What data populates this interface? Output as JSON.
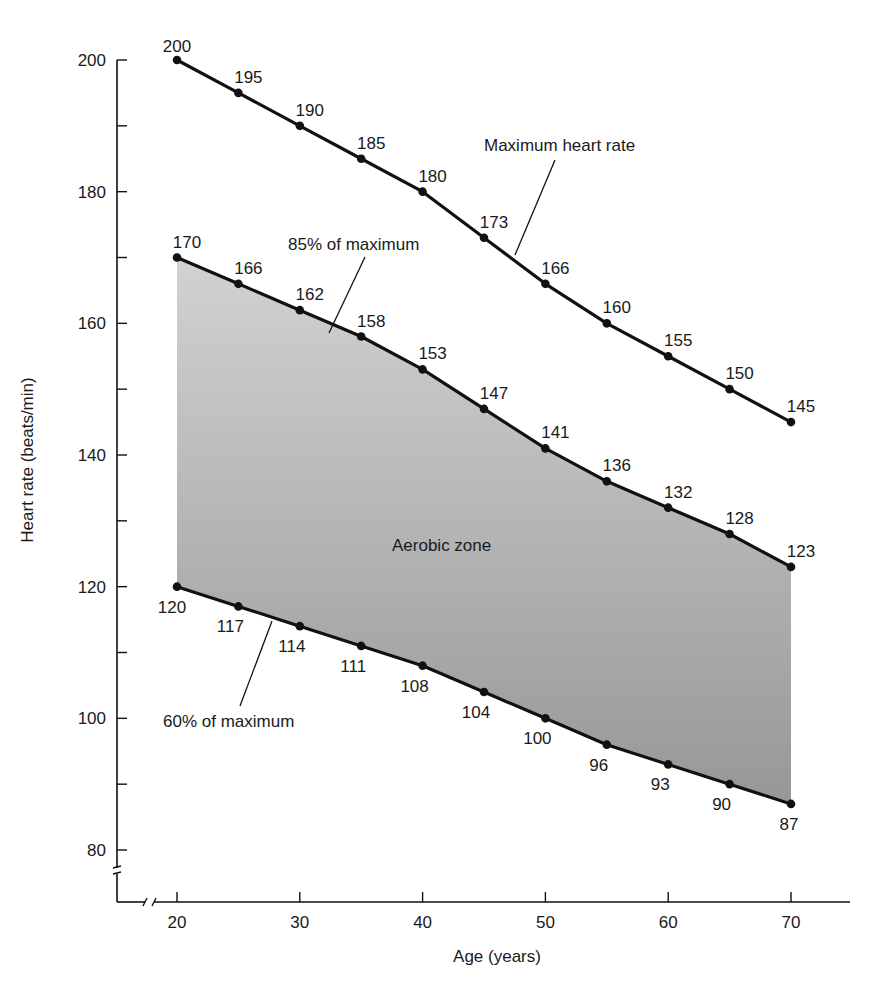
{
  "chart_data": {
    "type": "line",
    "title": "",
    "xlabel": "Age (years)",
    "ylabel": "Heart rate (beats/min)",
    "x": [
      20,
      25,
      30,
      35,
      40,
      45,
      50,
      55,
      60,
      65,
      70
    ],
    "x_ticks": [
      20,
      30,
      40,
      50,
      60,
      70
    ],
    "y_ticks": [
      80,
      100,
      120,
      140,
      160,
      180,
      200
    ],
    "y_minor_ticks": [
      90,
      110,
      130,
      150,
      170,
      190
    ],
    "xlim": [
      20,
      70
    ],
    "ylim": [
      80,
      200
    ],
    "axis_breaks": {
      "x": true,
      "y": true
    },
    "grid": false,
    "legend": "none (direct labels)",
    "series": [
      {
        "name": "Maximum heart rate",
        "values": [
          200,
          195,
          190,
          185,
          180,
          173,
          166,
          160,
          155,
          150,
          145
        ]
      },
      {
        "name": "85% of maximum",
        "values": [
          170,
          166,
          162,
          158,
          153,
          147,
          141,
          136,
          132,
          128,
          123
        ]
      },
      {
        "name": "60% of maximum",
        "values": [
          120,
          117,
          114,
          111,
          108,
          104,
          100,
          96,
          93,
          90,
          87
        ]
      }
    ],
    "shaded_region": {
      "label": "Aerobic zone",
      "between": [
        "60% of maximum",
        "85% of maximum"
      ]
    },
    "annotations": [
      "Maximum heart rate",
      "85% of maximum",
      "60% of maximum",
      "Aerobic zone"
    ]
  },
  "colors": {
    "line": "#111111",
    "fill_top": "#d2d2d2",
    "fill_bottom": "#979797",
    "text": "#1a1a1a"
  }
}
